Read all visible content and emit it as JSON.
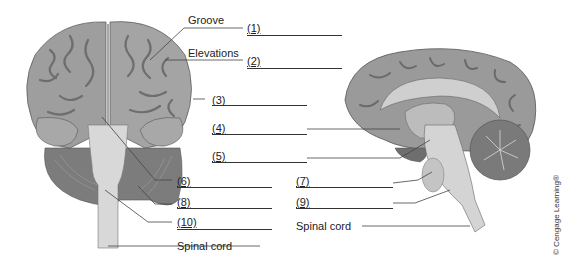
{
  "figure": {
    "views": [
      "anterior-view",
      "midsagittal-view"
    ]
  },
  "labels": {
    "groove": "Groove",
    "elevations": "Elevations",
    "spinal_cord_left": "Spinal cord",
    "spinal_cord_right": "Spinal cord"
  },
  "blanks": [
    {
      "number": "(1)"
    },
    {
      "number": "(2)"
    },
    {
      "number": "(3)"
    },
    {
      "number": "(4)"
    },
    {
      "number": "(5)"
    },
    {
      "number": "(6)"
    },
    {
      "number": "(7)"
    },
    {
      "number": "(8)"
    },
    {
      "number": "(9)"
    },
    {
      "number": "(10)"
    }
  ],
  "copyright": "© Cengage Learning®",
  "colors": {
    "cortex": "#9a9a9a",
    "cortex_dark": "#6e6e6e",
    "cerebellum": "#7c7c7c",
    "brainstem": "#d6d6d6",
    "line": "#333333"
  }
}
